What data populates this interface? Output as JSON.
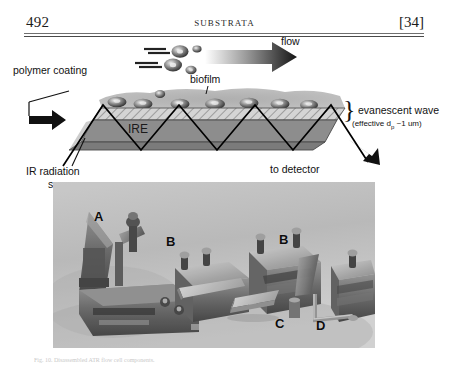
{
  "page": {
    "folio": "492",
    "running_head": "SUBSTRATA",
    "chapter_number": "[34]"
  },
  "schematic": {
    "flow_label": "flow",
    "polymer_coating_label": "polymer coating",
    "biofilm_label": "biofilm",
    "ire_label": "IRE",
    "ir_source_label_line1": "IR radiation",
    "ir_source_label_line2": "source",
    "detector_label": "to detector",
    "brace_glyph": "}",
    "evanescent_label": "evanescent wave",
    "evanescent_sub": "(effective d",
    "evanescent_sub_small": "p",
    "evanescent_sub_tail": " ~1 um)",
    "colors": {
      "ire_fill": "#8a8a8a",
      "ire_side": "#767676",
      "coating_fill": "#cfcfcf",
      "biofilm_fill": "#9a9a9a",
      "ray": "#000000",
      "arrow": "#111111"
    }
  },
  "photo": {
    "label_a": "A",
    "label_b1": "B",
    "label_b2": "B",
    "label_c": "C",
    "label_d": "D",
    "background_color": "#bdbdbd",
    "metal_color": "#6f6f6f"
  },
  "caption": {
    "text": "Fig. 10. Disassembled ATR flow cell components."
  }
}
